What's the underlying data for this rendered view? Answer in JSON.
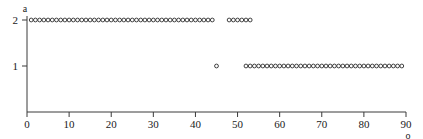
{
  "chart_data": {
    "type": "scatter",
    "title": "",
    "xlabel": "o",
    "ylabel": "a",
    "xlim": [
      0,
      90
    ],
    "ylim": [
      0,
      2.35
    ],
    "grid": false,
    "legend": null,
    "marker": "open-circle",
    "marker_color": "#2b2b2b",
    "xticks": [
      0,
      10,
      20,
      30,
      40,
      50,
      60,
      70,
      80,
      90
    ],
    "xticklabels": [
      "0",
      "10",
      "20",
      "30",
      "40",
      "50",
      "60",
      "70",
      "80",
      "90"
    ],
    "yticks": [
      0,
      1,
      2
    ],
    "yticklabels": [
      "0",
      "1",
      "2"
    ],
    "series": [
      {
        "name": "a=2",
        "y": 2,
        "x": [
          1,
          2,
          3,
          4,
          5,
          6,
          7,
          8,
          9,
          10,
          11,
          12,
          13,
          14,
          15,
          16,
          17,
          18,
          19,
          20,
          21,
          22,
          23,
          24,
          25,
          26,
          27,
          28,
          29,
          30,
          31,
          32,
          33,
          34,
          35,
          36,
          37,
          38,
          39,
          40,
          41,
          42,
          43,
          44,
          48,
          49,
          50,
          51,
          52,
          53
        ]
      },
      {
        "name": "a=1",
        "y": 1,
        "x": [
          45,
          52,
          53,
          54,
          55,
          56,
          57,
          58,
          59,
          60,
          61,
          62,
          63,
          64,
          65,
          66,
          67,
          68,
          69,
          70,
          71,
          72,
          73,
          74,
          75,
          76,
          77,
          78,
          79,
          80,
          81,
          82,
          83,
          84,
          85,
          86,
          87,
          88,
          89
        ]
      }
    ]
  },
  "axis": {
    "x_label": "o",
    "y_label": "a"
  }
}
